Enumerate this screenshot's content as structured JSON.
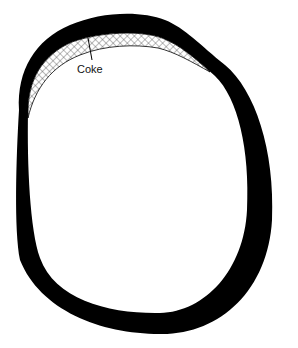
{
  "diagram": {
    "type": "cross-section",
    "labels": {
      "coke": "Coke"
    },
    "colors": {
      "wall": "#000000",
      "coke_hatch": "#555555",
      "background": "#ffffff"
    }
  }
}
